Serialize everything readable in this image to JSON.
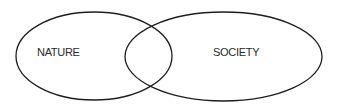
{
  "diagram": {
    "type": "venn",
    "sets": [
      {
        "id": "nature",
        "label": "NATURE"
      },
      {
        "id": "society",
        "label": "SOCIETY"
      }
    ],
    "stroke_color": "#1e1e1e",
    "background": "#ffffff"
  }
}
